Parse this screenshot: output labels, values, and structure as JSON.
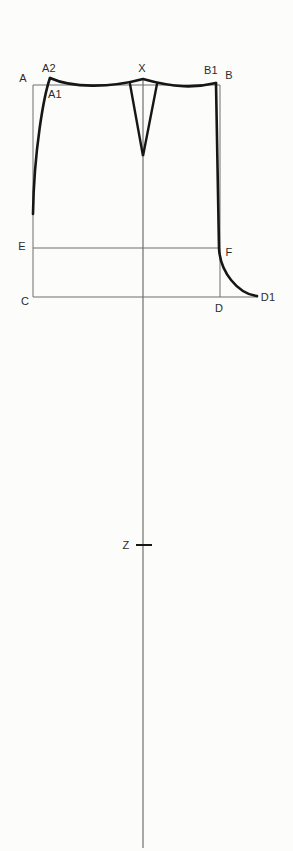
{
  "figure": {
    "type": "pattern-drafting-diagram",
    "labels": {
      "A": "A",
      "A2": "A2",
      "A1": "A1",
      "X": "X",
      "B1": "B1",
      "B": "B",
      "E": "E",
      "F": "F",
      "C": "C",
      "D": "D",
      "D1": "D1",
      "Z": "Z"
    },
    "colors": {
      "background": "#fcfcfa",
      "construction_line": "#6f6f6f",
      "outline": "#161616",
      "label_text": "#2b2b2b"
    }
  }
}
